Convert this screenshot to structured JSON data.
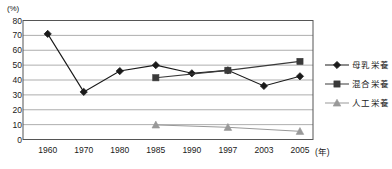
{
  "chart_data": {
    "type": "line",
    "title": "",
    "subtitle": "",
    "xlabel": "年",
    "ylabel": "(%)",
    "unit_label": "(%)",
    "x_unit_label": "(年)",
    "categories": [
      "1960",
      "1970",
      "1980",
      "1985",
      "1990",
      "1997",
      "2003",
      "2005"
    ],
    "ylim": [
      0,
      80
    ],
    "yticks": [
      0,
      10,
      20,
      30,
      40,
      50,
      60,
      70,
      80
    ],
    "ytick_labels": [
      "0",
      "10",
      "20",
      "30",
      "40",
      "50",
      "60",
      "70",
      "80"
    ],
    "grid": true,
    "grid_axis": "y",
    "legend_position": "right",
    "series": [
      {
        "name": "母乳栄養",
        "marker": "diamond",
        "color": "#1a1a1a",
        "values": [
          71,
          32,
          46,
          50,
          44.5,
          46.5,
          36,
          42.5
        ],
        "points": [
          {
            "x": "1960",
            "y": 71
          },
          {
            "x": "1970",
            "y": 32
          },
          {
            "x": "1980",
            "y": 46
          },
          {
            "x": "1985",
            "y": 50
          },
          {
            "x": "1990",
            "y": 44.5
          },
          {
            "x": "1997",
            "y": 46.5
          },
          {
            "x": "2003",
            "y": 36
          },
          {
            "x": "2005",
            "y": 42.5
          }
        ]
      },
      {
        "name": "混合栄養",
        "marker": "square",
        "color": "#3a3a3a",
        "values": [
          null,
          null,
          null,
          41.5,
          null,
          46.5,
          null,
          52.5
        ],
        "points": [
          {
            "x": "1985",
            "y": 41.5
          },
          {
            "x": "1997",
            "y": 46.5
          },
          {
            "x": "2005",
            "y": 52.5
          }
        ]
      },
      {
        "name": "人工栄養",
        "marker": "triangle",
        "color": "#999999",
        "values": [
          null,
          null,
          null,
          9.8,
          null,
          8.2,
          null,
          5.5
        ],
        "points": [
          {
            "x": "1985",
            "y": 9.8
          },
          {
            "x": "1997",
            "y": 8.2
          },
          {
            "x": "2005",
            "y": 5.5
          }
        ]
      }
    ]
  },
  "legend": {
    "items": [
      {
        "label": "母乳栄養",
        "marker": "diamond",
        "color": "#1a1a1a"
      },
      {
        "label": "混合栄養",
        "marker": "square",
        "color": "#3a3a3a"
      },
      {
        "label": "人工栄養",
        "marker": "triangle",
        "color": "#999999"
      }
    ]
  }
}
